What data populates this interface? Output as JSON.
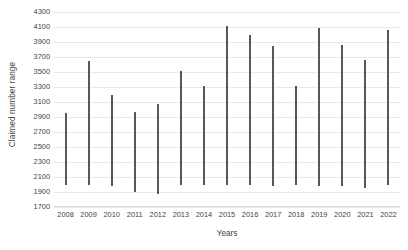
{
  "chart_data": {
    "type": "bar",
    "subtype": "floating-range-bar",
    "title": "",
    "xlabel": "Years",
    "ylabel": "Claimed number range",
    "categories": [
      "2008",
      "2009",
      "2010",
      "2011",
      "2012",
      "2013",
      "2014",
      "2015",
      "2016",
      "2017",
      "2018",
      "2019",
      "2020",
      "2021",
      "2022"
    ],
    "series": [
      {
        "name": "Claimed number range",
        "low": [
          1990,
          1995,
          1980,
          1900,
          1880,
          1990,
          1990,
          1990,
          1990,
          1985,
          1990,
          1980,
          1985,
          1960,
          1990
        ],
        "high": [
          2960,
          3650,
          3190,
          2970,
          3080,
          3520,
          3310,
          4110,
          4000,
          3850,
          3320,
          4090,
          3860,
          3660,
          4060
        ]
      }
    ],
    "ylim": [
      1700,
      4300
    ],
    "ytick_step": 200,
    "yticks": [
      "4300",
      "4100",
      "3900",
      "3700",
      "3500",
      "3300",
      "3100",
      "2900",
      "2700",
      "2500",
      "2300",
      "2100",
      "1900",
      "1700"
    ],
    "grid": true,
    "grid_axis": "y",
    "legend": "none",
    "colors": {
      "bar": "#585858",
      "gridline": "#e9e9e9",
      "axis": "#d9d9d9",
      "text": "#3f3f3f",
      "background": "#ffffff"
    }
  }
}
